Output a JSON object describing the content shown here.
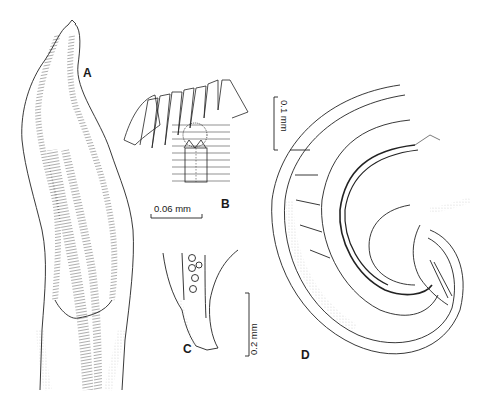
{
  "figure": {
    "panels": [
      {
        "id": "A",
        "label": "A",
        "description": "anterior end, elongate body with striated cuticle"
      },
      {
        "id": "B",
        "label": "B",
        "description": "cephalic detail, fan of spines above rounded structure"
      },
      {
        "id": "C",
        "label": "C",
        "description": "tail tip with egg-like spheres"
      },
      {
        "id": "D",
        "label": "D",
        "description": "coiled posterior end with spicules"
      }
    ],
    "scale_bars": [
      {
        "id": "B",
        "text": "0.06 mm",
        "orientation": "horizontal"
      },
      {
        "id": "D",
        "text": "0.1 mm",
        "orientation": "vertical"
      },
      {
        "id": "C",
        "text": "0.2 mm",
        "orientation": "vertical"
      }
    ]
  }
}
